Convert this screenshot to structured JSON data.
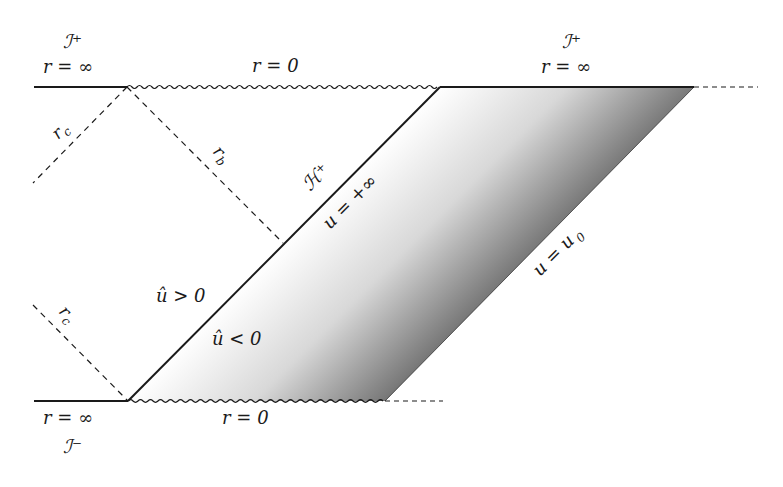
{
  "diagram": {
    "colors": {
      "line": "#1a1a1a",
      "gradient_start": "#ffffff",
      "gradient_end": "#111111"
    },
    "labels": {
      "scri_plus_left": "ℐ⁺",
      "r_inf_top_left": "r = ∞",
      "r_zero_top": "r = 0",
      "scri_plus_right": "ℐ⁺",
      "r_inf_top_right": "r = ∞",
      "r_c_upper": "r",
      "r_c_upper_sub": "c",
      "r_b": "r",
      "r_b_sub": "b",
      "horizon": "ℋ⁺",
      "u_plus_inf": "u = +∞",
      "u_hat_pos": "û > 0",
      "u_hat_neg": "û < 0",
      "r_c_lower": "r",
      "r_c_lower_sub": "c",
      "u_u0": "u = u",
      "u_u0_sub": "0",
      "r_inf_bottom": "r = ∞",
      "r_zero_bottom": "r = 0",
      "scri_minus": "ℐ⁻"
    }
  }
}
